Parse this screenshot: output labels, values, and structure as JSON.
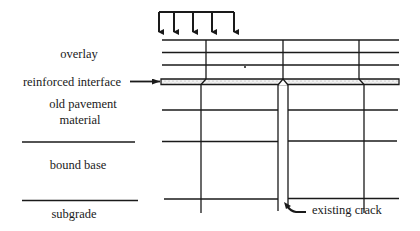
{
  "diagram": {
    "type": "pavement cross-section",
    "load_arrows": {
      "count": 5
    },
    "layers": [
      {
        "id": "overlay",
        "label": "overlay"
      },
      {
        "id": "reinforced-interface",
        "label": "reinforced interface"
      },
      {
        "id": "old-pavement",
        "label_line1": "old pavement",
        "label_line2": "material"
      },
      {
        "id": "bound-base",
        "label": "bound base"
      },
      {
        "id": "subgrade",
        "label": "subgrade"
      }
    ],
    "annotations": {
      "existing_crack": "existing crack"
    },
    "colors": {
      "line": "#1a1a1a",
      "background": "#ffffff",
      "interface_fill": "#e8e8e8"
    }
  }
}
